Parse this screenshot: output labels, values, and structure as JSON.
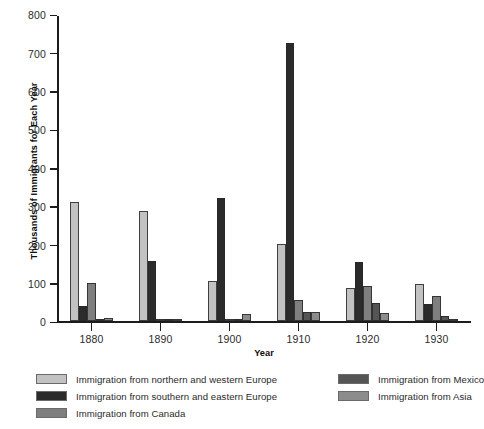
{
  "chart_data": {
    "type": "bar",
    "title": "",
    "xlabel": "Year",
    "ylabel": "Thousands of Immigrants for Each Year",
    "categories": [
      "1880",
      "1890",
      "1900",
      "1910",
      "1920",
      "1930"
    ],
    "ylim": [
      0,
      800
    ],
    "yticks": [
      "0",
      "100",
      "200",
      "300",
      "400",
      "500",
      "600",
      "700",
      "800"
    ],
    "grid": false,
    "legend_position": "bottom",
    "series": [
      {
        "name": "Immigration from northern and western Europe",
        "color": "#c2c2c2",
        "values": [
          310,
          287,
          105,
          201,
          87,
          97
        ]
      },
      {
        "name": "Immigration from southern and eastern Europe",
        "color": "#2b2b2b",
        "values": [
          40,
          158,
          322,
          725,
          155,
          45
        ]
      },
      {
        "name": "Immigration from Canada",
        "color": "#7f7f7f",
        "values": [
          100,
          3,
          2,
          55,
          92,
          65
        ]
      },
      {
        "name": "Immigration from Mexico",
        "color": "#555555",
        "values": [
          2,
          2,
          4,
          25,
          49,
          13
        ]
      },
      {
        "name": "Immigration from Asia",
        "color": "#8c8c8c",
        "values": [
          8,
          3,
          20,
          25,
          22,
          5
        ]
      }
    ]
  },
  "legend": {
    "left_column": [
      "Immigration from northern and western Europe",
      "Immigration from southern and eastern Europe",
      "Immigration from Canada"
    ],
    "right_column": [
      "Immigration from Mexico",
      "Immigration from Asia"
    ]
  }
}
